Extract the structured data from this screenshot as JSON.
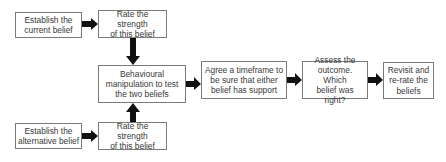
{
  "diagram": {
    "type": "flowchart",
    "nodes": [
      {
        "id": "establish_current",
        "label": "Establish the\ncurrent belief"
      },
      {
        "id": "rate_current",
        "label": "Rate the strength\nof this belief"
      },
      {
        "id": "behavioural",
        "label": "Behavioural\nmanipulation to test\nthe two beliefs"
      },
      {
        "id": "timeframe",
        "label": "Agree a timeframe to\nbe sure that either\nbelief has support"
      },
      {
        "id": "assess",
        "label": "Assess the\noutcome. Which\nbelief was right?"
      },
      {
        "id": "revisit",
        "label": "Revisit and\nre-rate the\nbeliefs"
      },
      {
        "id": "establish_alt",
        "label": "Establish the\nalternative belief"
      },
      {
        "id": "rate_alt",
        "label": "Rate the strength\nof this belief"
      }
    ],
    "edges": [
      {
        "from": "establish_current",
        "to": "rate_current"
      },
      {
        "from": "rate_current",
        "to": "behavioural"
      },
      {
        "from": "establish_alt",
        "to": "rate_alt"
      },
      {
        "from": "rate_alt",
        "to": "behavioural"
      },
      {
        "from": "behavioural",
        "to": "timeframe"
      },
      {
        "from": "timeframe",
        "to": "assess"
      },
      {
        "from": "assess",
        "to": "revisit"
      }
    ],
    "colors": {
      "border": "#7a7a7a",
      "arrow": "#111111",
      "text": "#3a3a3a"
    }
  }
}
